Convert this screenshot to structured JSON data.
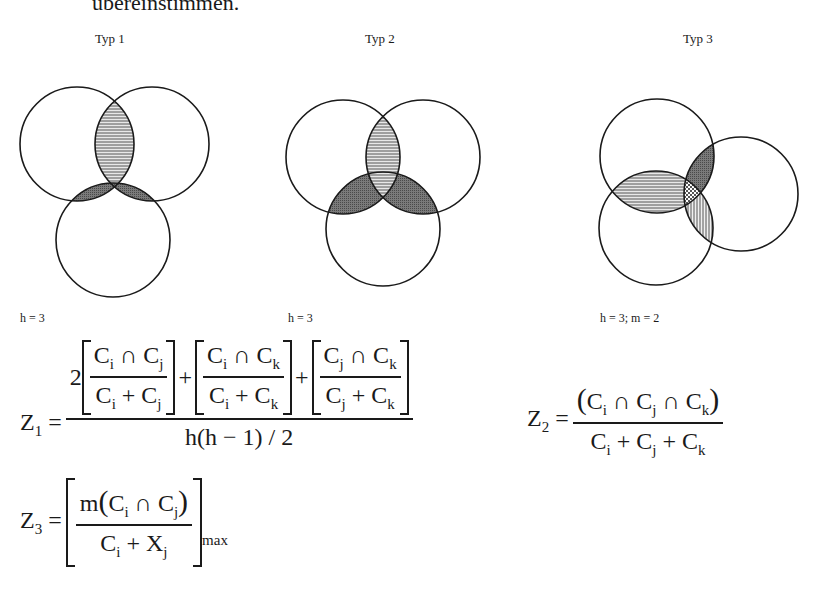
{
  "header": {
    "cutoff_text": "übereinstimmen."
  },
  "diagrams": [
    {
      "title": "Typ 1",
      "label": "h = 3",
      "circles": [
        {
          "cx": 77,
          "cy": 144,
          "r": 57
        },
        {
          "cx": 152,
          "cy": 144,
          "r": 57
        },
        {
          "cx": 113,
          "cy": 240,
          "r": 57
        }
      ],
      "shaded_regions": [
        "top-left ∩ top-right (horizontal lines)",
        "top-left ∩ bottom (dark)",
        "top-right ∩ bottom (dark)"
      ]
    },
    {
      "title": "Typ 2",
      "label": "h = 3",
      "circles": [
        {
          "cx": 343,
          "cy": 157,
          "r": 57
        },
        {
          "cx": 423,
          "cy": 157,
          "r": 57
        },
        {
          "cx": 383,
          "cy": 229,
          "r": 57
        }
      ],
      "shaded_regions": [
        "top-left ∩ top-right (horizontal lines)",
        "top-left ∩ bottom (dark)",
        "top-right ∩ bottom (dark)"
      ]
    },
    {
      "title": "Typ 3",
      "label": "h = 3;  m = 2",
      "circles": [
        {
          "cx": 657,
          "cy": 156,
          "r": 57
        },
        {
          "cx": 656,
          "cy": 228,
          "r": 57
        },
        {
          "cx": 741,
          "cy": 194,
          "r": 57
        }
      ],
      "shaded_regions": [
        "top ∩ bottom-left (horizontal lines)",
        "top ∩ right (dark)",
        "bottom-left ∩ right (vertical lines)",
        "triple intersection (cross-hatch)"
      ]
    }
  ],
  "formulas": {
    "z1": {
      "lhs": "Z",
      "lhs_sub": "1",
      "eq": "=",
      "coef": "2",
      "terms": [
        {
          "num": "C_i ∩ C_j",
          "den": "C_i + C_j"
        },
        {
          "num": "C_i ∩ C_k",
          "den": "C_i + C_k"
        },
        {
          "num": "C_j ∩ C_k",
          "den": "C_j + C_k"
        }
      ],
      "plus": "+",
      "denominator": "h(h − 1) / 2"
    },
    "z2": {
      "lhs": "Z",
      "lhs_sub": "2",
      "eq": "=",
      "numerator": "(C_i ∩ C_j ∩ C_k)",
      "denominator": "C_i + C_j + C_k"
    },
    "z3": {
      "lhs": "Z",
      "lhs_sub": "3",
      "eq": "=",
      "numerator": "m(C_i ∩ C_j)",
      "denominator": "C_i + X_j",
      "subscript": "max"
    }
  },
  "sym": {
    "C": "C",
    "X": "X",
    "m": "m",
    "h": "h",
    "i": "i",
    "j": "j",
    "k": "k",
    "cap": "∩",
    "plus": "+",
    "eq": "=",
    "two": "2",
    "lp": "(",
    "rp": ")",
    "minus": "−",
    "one": "1",
    "slash": "/"
  }
}
